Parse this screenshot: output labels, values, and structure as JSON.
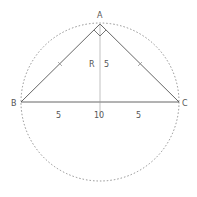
{
  "diagram": {
    "type": "geometry",
    "vertices": {
      "A": {
        "label": "A",
        "x": 100,
        "y": 24
      },
      "B": {
        "label": "B",
        "x": 21,
        "y": 102
      },
      "C": {
        "label": "C",
        "x": 179,
        "y": 102
      }
    },
    "circle": {
      "cx": 100,
      "cy": 102,
      "r": 79,
      "style": "dashed"
    },
    "right_angle_at": "A",
    "altitude": {
      "from": "A",
      "to_x": 100,
      "to_y": 102
    },
    "labels": {
      "altitude_label": "R",
      "altitude_length": "5",
      "left_segment": "5",
      "hypotenuse": "10",
      "right_segment": "5"
    },
    "equal_side_ticks": [
      "AB",
      "AC"
    ],
    "colors": {
      "line": "#555555",
      "circle": "#777777",
      "text": "#555555"
    }
  }
}
